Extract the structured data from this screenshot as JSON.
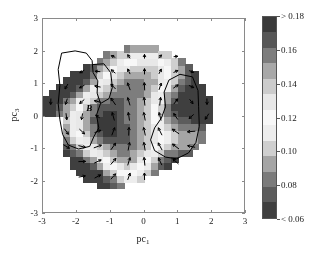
{
  "figure": {
    "background": "#ffffff",
    "annotation": {
      "label": "B",
      "x_data": -1.72,
      "y_data": 0.42
    }
  },
  "axes": {
    "xlabel_prefix": "pc",
    "xlabel_sub": "1",
    "ylabel_prefix": "pc",
    "ylabel_sub": "3",
    "xlim": [
      -3,
      3
    ],
    "ylim": [
      -3,
      3
    ],
    "xticks": [
      -3,
      -2,
      -1,
      0,
      1,
      2,
      3
    ],
    "xticklabels": [
      "-3",
      "-2",
      "-1",
      "0",
      "1",
      "2",
      "3"
    ],
    "yticks": [
      -3,
      -2,
      -1,
      0,
      1,
      2,
      3
    ],
    "yticklabels": [
      "-3",
      "-2",
      "-1",
      "0",
      "1",
      "2",
      "3"
    ],
    "frame_color": "#8a8a8a"
  },
  "colorbar": {
    "title": "Standard deviation per day",
    "ticklabels": [
      "> 0.18",
      "0.16",
      "0.14",
      "0.12",
      "0.10",
      "0.08",
      "< 0.06"
    ],
    "tickvalues": [
      0.18,
      0.16,
      0.14,
      0.12,
      0.1,
      0.08,
      0.06
    ],
    "orientation": "vertical",
    "band_colors": [
      "#3a3a3a",
      "#575757",
      "#7d7d7d",
      "#a8a8a8",
      "#cccccc",
      "#e8e8e8",
      "#f7f7f7",
      "#ededed",
      "#cfcfcf",
      "#a5a5a5",
      "#7b7b7b",
      "#5c5c5c",
      "#3f3f3f"
    ]
  },
  "chart_data": {
    "type": "heatmap",
    "title": "",
    "xlabel": "pc_1",
    "ylabel": "pc_3",
    "clabel": "Standard deviation per day",
    "xlim": [
      -3,
      3
    ],
    "ylim": [
      -3,
      3
    ],
    "clim": [
      0.06,
      0.18
    ],
    "grid": false,
    "legend": "none",
    "colormap": "grayscale-banded",
    "overlays": [
      "quiver-vector-field",
      "black-contour-line",
      "text-annotation-B"
    ],
    "nx": 30,
    "ny": 30,
    "note": "Grayscale field of standard deviation per day over the pc1-pc3 plane; light interior (low sigma ~0.10-0.13) surrounded by dark rim (high sigma > 0.18); two dark lobes near (-2.0,1.3) and (1.1,0.3); vector field arrows show circulation; black contour encloses a basin labelled B.",
    "field_peaks": [
      {
        "x": -2.0,
        "y": 1.3,
        "value": 0.17
      },
      {
        "x": 1.1,
        "y": 0.3,
        "value": 0.17
      },
      {
        "x": 0.7,
        "y": -1.5,
        "value": 0.165
      },
      {
        "x": -1.8,
        "y": -2.1,
        "value": 0.18
      }
    ],
    "field_valleys": [
      {
        "x": -1.3,
        "y": -0.3,
        "value": 0.105
      },
      {
        "x": 0.1,
        "y": 1.3,
        "value": 0.11
      },
      {
        "x": 1.6,
        "y": -0.8,
        "value": 0.115
      },
      {
        "x": -0.4,
        "y": -1.6,
        "value": 0.12
      }
    ],
    "data_extent_note": "Data masked to an irregular blob roughly spanning x in [-2.7,1.9], y in [-3,3]."
  }
}
